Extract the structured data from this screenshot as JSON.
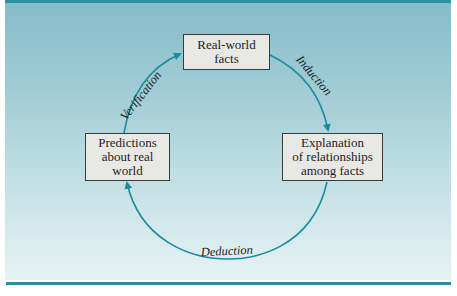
{
  "diagram": {
    "type": "cycle",
    "colors": {
      "rule": "#2f8fa3",
      "arrow": "#1a8ca0",
      "panel_top": "#86bcc9",
      "panel_bottom": "#e6f3f3",
      "box_fill": "#e8e8e5",
      "box_border": "#3a3a3a"
    },
    "nodes": {
      "top": {
        "line1": "Real-world",
        "line2": "facts"
      },
      "right": {
        "line1": "Explanation",
        "line2": "of relationships",
        "line3": "among facts"
      },
      "left": {
        "line1": "Predictions",
        "line2": "about real",
        "line3": "world"
      }
    },
    "edges": {
      "induction": {
        "label": "Induction",
        "from": "Real-world facts",
        "to": "Explanation of relationships among facts"
      },
      "deduction": {
        "label": "Deduction",
        "from": "Explanation of relationships among facts",
        "to": "Predictions about real world"
      },
      "verification": {
        "label": "Verification",
        "from": "Predictions about real world",
        "to": "Real-world facts"
      }
    }
  }
}
